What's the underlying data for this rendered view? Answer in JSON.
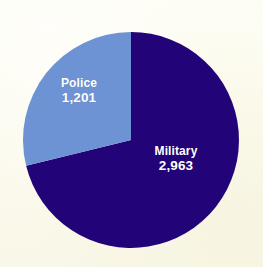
{
  "chart_data": {
    "type": "pie",
    "title": "",
    "categories": [
      "Military",
      "Police"
    ],
    "values": [
      2963,
      1201
    ],
    "labels": [
      "2,963",
      "1,201"
    ],
    "total": 4164,
    "percentages": [
      71.2,
      28.8
    ],
    "legend": "none",
    "grid": false,
    "colors": {
      "military": "#230378",
      "police": "#6e93d4",
      "background": "#fdfcf0",
      "label_text": "#ffffff"
    },
    "slices": [
      {
        "name": "Military",
        "value_label": "2,963",
        "value": 2963,
        "color": "#230378",
        "start_angle_deg": 0,
        "end_angle_deg": 256.2
      },
      {
        "name": "Police",
        "value_label": "1,201",
        "value": 1201,
        "color": "#6e93d4",
        "start_angle_deg": 256.2,
        "end_angle_deg": 360
      }
    ],
    "geometry": {
      "center_x": 131,
      "center_y": 140,
      "radius": 108
    }
  }
}
